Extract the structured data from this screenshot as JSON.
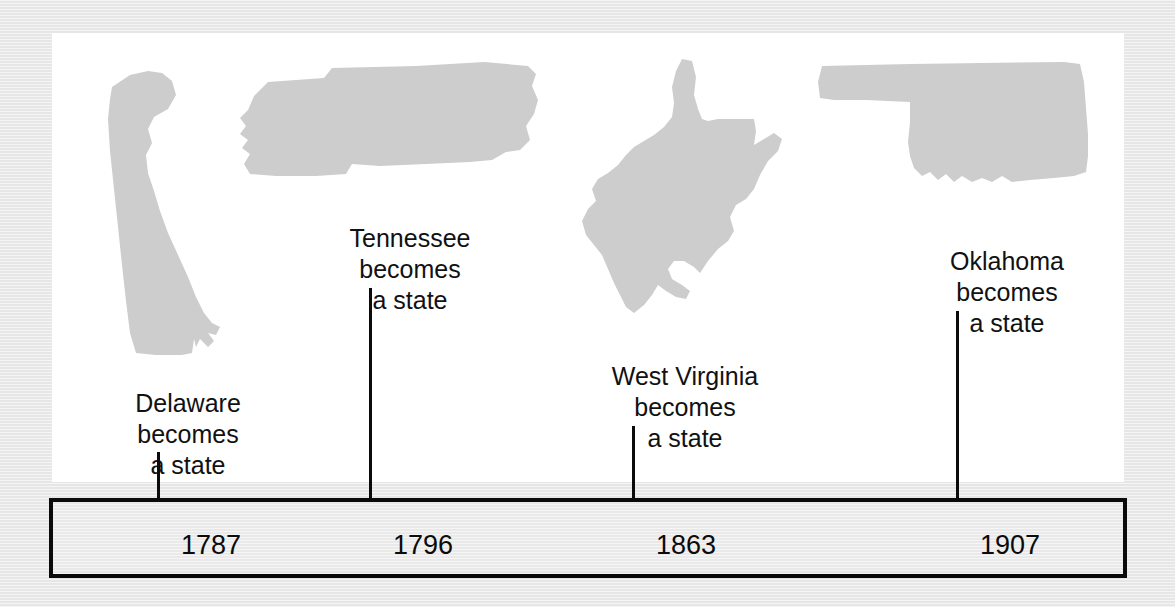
{
  "figure": {
    "type": "timeline",
    "background_color": "#e9e9e9",
    "panel_color": "#ffffff",
    "shape_fill_color": "#cdcdcd",
    "line_color": "#0b0b0b"
  },
  "events": [
    {
      "state": "Delaware",
      "year": "1787",
      "caption_line1": "Delaware",
      "caption_line2": "becomes",
      "caption_line3": "a state",
      "shape_name": "delaware-state-shape"
    },
    {
      "state": "Tennessee",
      "year": "1796",
      "caption_line1": "Tennessee",
      "caption_line2": "becomes",
      "caption_line3": "a state",
      "shape_name": "tennessee-state-shape"
    },
    {
      "state": "West Virginia",
      "year": "1863",
      "caption_line1": "West Virginia",
      "caption_line2": "becomes",
      "caption_line3": "a state",
      "shape_name": "west-virginia-state-shape"
    },
    {
      "state": "Oklahoma",
      "year": "1907",
      "caption_line1": "Oklahoma",
      "caption_line2": "becomes",
      "caption_line3": "a state",
      "shape_name": "oklahoma-state-shape"
    }
  ],
  "timeline": {
    "years": [
      "1787",
      "1796",
      "1863",
      "1907"
    ]
  }
}
